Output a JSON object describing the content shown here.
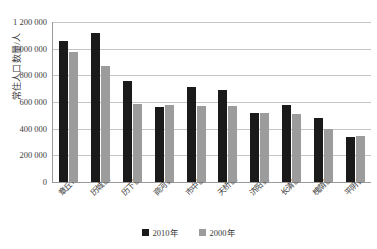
{
  "chart_data": {
    "type": "bar",
    "title": "",
    "xlabel": "",
    "ylabel": "常住人口数量/人",
    "ylim": [
      0,
      1200000
    ],
    "grid": true,
    "legend_position": "bottom",
    "categories": [
      "章丘市",
      "历城区",
      "历下区",
      "商河县",
      "市中区",
      "天桥区",
      "济阳县",
      "长清区",
      "槐荫区",
      "平阴县"
    ],
    "y_ticks": [
      "0",
      "200 000",
      "400 000",
      "600 000",
      "800 000",
      "1 000 000",
      "1 200 000"
    ],
    "y_tick_values": [
      0,
      200000,
      400000,
      600000,
      800000,
      1000000,
      1200000
    ],
    "series": [
      {
        "name": "2010年",
        "color": "#1a1a1a",
        "values": [
          1060000,
          1120000,
          755000,
          565000,
          710000,
          690000,
          520000,
          578000,
          482000,
          335000
        ]
      },
      {
        "name": "2000年",
        "color": "#9c9c9c",
        "values": [
          975000,
          870000,
          585000,
          575000,
          570000,
          570000,
          518000,
          508000,
          400000,
          345000
        ]
      }
    ]
  }
}
